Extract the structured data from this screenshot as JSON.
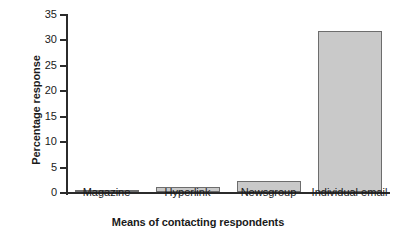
{
  "chart_data": {
    "type": "bar",
    "title": "",
    "subtitle": "",
    "xlabel": "Means of contacting respondents",
    "ylabel": "Percentage response",
    "categories": [
      "Magazine",
      "Hyperlink",
      "Newsgroup",
      "Individual email"
    ],
    "values": [
      0.2,
      0.9,
      2.2,
      31.6
    ],
    "series": [
      {
        "name": "Percentage response",
        "values": [
          0.2,
          0.9,
          2.2,
          31.6
        ]
      }
    ],
    "ylim": [
      0,
      35
    ],
    "yticks": [
      0,
      5,
      10,
      15,
      20,
      25,
      30,
      35
    ],
    "ytick_labels": [
      "0",
      "5",
      "10",
      "15",
      "20",
      "25",
      "30",
      "35"
    ],
    "grid": false,
    "legend": false,
    "legend_position": "none",
    "annotations": []
  },
  "style": {
    "bar_fill": "#c9c9c9",
    "bar_border": "#6d6d6d",
    "axis_color": "#2b2b2b",
    "background": "#ffffff",
    "text_color": "#1a1a1a"
  }
}
